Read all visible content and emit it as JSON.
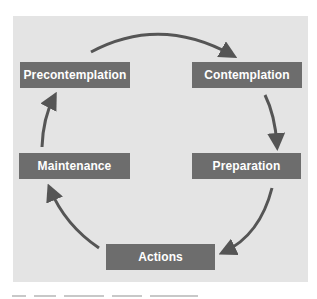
{
  "diagram": {
    "type": "cycle",
    "background_color": "#e4e4e4",
    "box_color": "#6d6d6d",
    "text_color": "#ffffff",
    "arrow_color": "#555555",
    "stages": [
      {
        "id": "precontemplation",
        "label": "Precontemplation"
      },
      {
        "id": "contemplation",
        "label": "Contemplation"
      },
      {
        "id": "preparation",
        "label": "Preparation"
      },
      {
        "id": "actions",
        "label": "Actions"
      },
      {
        "id": "maintenance",
        "label": "Maintenance"
      }
    ],
    "edges": [
      {
        "from": "precontemplation",
        "to": "contemplation"
      },
      {
        "from": "contemplation",
        "to": "preparation"
      },
      {
        "from": "preparation",
        "to": "actions"
      },
      {
        "from": "actions",
        "to": "maintenance"
      },
      {
        "from": "maintenance",
        "to": "precontemplation"
      }
    ]
  }
}
